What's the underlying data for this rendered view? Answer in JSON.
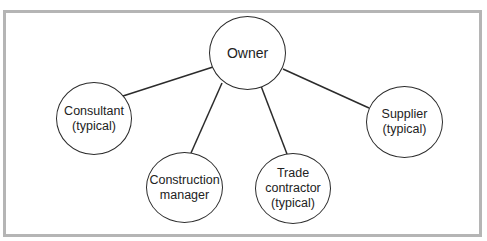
{
  "diagram": {
    "type": "organization-relationship",
    "colors": {
      "frame_border": "#b5b5b5",
      "node_stroke": "#2b2b2b",
      "text": "#222222",
      "background": "#ffffff"
    },
    "nodes": [
      {
        "id": "owner",
        "lines": [
          "Owner"
        ]
      },
      {
        "id": "consultant",
        "lines": [
          "Consultant",
          "(typical)"
        ]
      },
      {
        "id": "construction_manager",
        "lines": [
          "Construction",
          "manager"
        ]
      },
      {
        "id": "trade_contractor",
        "lines": [
          "Trade",
          "contractor",
          "(typical)"
        ]
      },
      {
        "id": "supplier",
        "lines": [
          "Supplier",
          "(typical)"
        ]
      }
    ],
    "edges": [
      {
        "from": "owner",
        "to": "consultant"
      },
      {
        "from": "owner",
        "to": "construction_manager"
      },
      {
        "from": "owner",
        "to": "trade_contractor"
      },
      {
        "from": "owner",
        "to": "supplier"
      }
    ]
  }
}
